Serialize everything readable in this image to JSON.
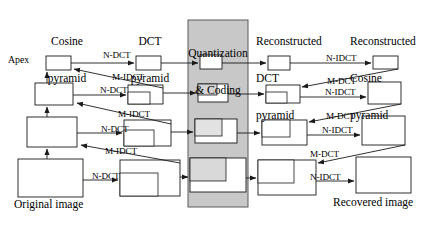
{
  "diagram": {
    "type": "block-flow",
    "colors": {
      "stroke": "#1a1a1a",
      "background": "#ffffff",
      "panel_fill": "#c8c8c8",
      "panel_stroke": "#555555",
      "nested_fill_light": "#e8e8e8",
      "nested_fill_mid": "#d4d4d4"
    },
    "headers": [
      {
        "id": "cosine-pyramid",
        "lines": [
          "Cosine",
          "pyramid"
        ]
      },
      {
        "id": "dct-pyramid",
        "lines": [
          "DCT",
          "pyramid"
        ]
      },
      {
        "id": "quantization-coding",
        "lines": [
          "Quantization",
          "& Coding"
        ]
      },
      {
        "id": "reconstructed-dct-pyramid",
        "lines": [
          "Reconstructed",
          "DCT",
          "pyramid"
        ]
      },
      {
        "id": "reconstructed-cosine-pyramid",
        "lines": [
          "Reconstructed",
          "Cosine",
          "pyramid"
        ]
      }
    ],
    "captions": {
      "apex": "Apex",
      "original_image": "Original image",
      "recovered_image": "Recovered image"
    },
    "operations": {
      "forward_dct": "N-DCT",
      "inverse_dct_up": "M-IDCT",
      "inverse_dct": "N-IDCT",
      "forward_dct_down": "M-DCT"
    },
    "edge_labels": [
      {
        "id": "ndct-level-1",
        "text": "N-DCT",
        "x": 103,
        "y": 51
      },
      {
        "id": "midct-level-1",
        "text": "M-IDCT",
        "x": 112,
        "y": 73
      },
      {
        "id": "ndct-level-2",
        "text": "N-DCT",
        "x": 100,
        "y": 86
      },
      {
        "id": "midct-level-2",
        "text": "M-IDCT",
        "x": 118,
        "y": 110
      },
      {
        "id": "ndct-level-3",
        "text": "N-DCT",
        "x": 101,
        "y": 125
      },
      {
        "id": "midct-level-3",
        "text": "M-IDCT",
        "x": 105,
        "y": 147
      },
      {
        "id": "ndct-level-4",
        "text": "N-DCT",
        "x": 92,
        "y": 176
      },
      {
        "id": "nidct-level-1",
        "text": "N-IDCT",
        "x": 326,
        "y": 54
      },
      {
        "id": "mdct-level-1",
        "text": "M-DCT",
        "x": 327,
        "y": 77
      },
      {
        "id": "nidct-level-2",
        "text": "N-IDCT",
        "x": 325,
        "y": 91
      },
      {
        "id": "mdct-level-2",
        "text": "M-DCT",
        "x": 326,
        "y": 114
      },
      {
        "id": "nidct-level-3",
        "text": "N-IDCT",
        "x": 322,
        "y": 128
      },
      {
        "id": "mdct-level-3",
        "text": "M-DCT",
        "x": 310,
        "y": 152
      },
      {
        "id": "nidct-level-4",
        "text": "N-IDCT",
        "x": 310,
        "y": 180
      }
    ],
    "levels": [
      {
        "level": 1,
        "cosine": {
          "x": 46,
          "y": 56,
          "w": 25,
          "h": 14
        },
        "dct": {
          "x": 136,
          "y": 56,
          "w": 25,
          "h": 14,
          "nested": null
        },
        "quant": {
          "x": 200,
          "y": 55,
          "w": 22,
          "h": 14,
          "nested": null
        },
        "recon_dct": {
          "x": 268,
          "y": 56,
          "w": 22,
          "h": 14,
          "nested": null
        },
        "recon_cos": {
          "x": 373,
          "y": 56,
          "w": 25,
          "h": 13
        }
      },
      {
        "level": 2,
        "cosine": {
          "x": 35,
          "y": 83,
          "w": 38,
          "h": 22
        },
        "dct": {
          "x": 128,
          "y": 85,
          "w": 35,
          "h": 19,
          "nested": {
            "x": 128,
            "y": 92,
            "w": 22,
            "h": 12
          }
        },
        "quant": {
          "x": 198,
          "y": 84,
          "w": 30,
          "h": 18,
          "nested": {
            "x": 198,
            "y": 91,
            "w": 19,
            "h": 11
          }
        },
        "recon_dct": {
          "x": 266,
          "y": 85,
          "w": 34,
          "h": 18,
          "nested": {
            "x": 266,
            "y": 92,
            "w": 21,
            "h": 11
          }
        },
        "recon_cos": {
          "x": 368,
          "y": 82,
          "w": 33,
          "h": 22
        }
      },
      {
        "level": 3,
        "cosine": {
          "x": 27,
          "y": 117,
          "w": 50,
          "h": 30
        },
        "dct": {
          "x": 124,
          "y": 120,
          "w": 47,
          "h": 26,
          "nested": {
            "x": 124,
            "y": 130,
            "w": 30,
            "h": 16
          }
        },
        "quant": {
          "x": 195,
          "y": 119,
          "w": 42,
          "h": 24,
          "nested": {
            "x": 195,
            "y": 119,
            "w": 27,
            "h": 17
          }
        },
        "recon_dct": {
          "x": 262,
          "y": 120,
          "w": 45,
          "h": 25,
          "nested": {
            "x": 262,
            "y": 120,
            "w": 28,
            "h": 17
          }
        },
        "recon_cos": {
          "x": 362,
          "y": 116,
          "w": 43,
          "h": 29
        }
      },
      {
        "level": 4,
        "cosine": {
          "x": 18,
          "y": 159,
          "w": 65,
          "h": 38
        },
        "dct": {
          "x": 120,
          "y": 160,
          "w": 60,
          "h": 36,
          "nested": {
            "x": 120,
            "y": 173,
            "w": 38,
            "h": 23
          }
        },
        "quant": {
          "x": 190,
          "y": 158,
          "w": 56,
          "h": 34,
          "nested": {
            "x": 190,
            "y": 158,
            "w": 36,
            "h": 23
          }
        },
        "recon_dct": {
          "x": 258,
          "y": 160,
          "w": 58,
          "h": 35,
          "nested": {
            "x": 258,
            "y": 160,
            "w": 36,
            "h": 23
          }
        },
        "recon_cos": {
          "x": 356,
          "y": 157,
          "w": 55,
          "h": 36
        }
      }
    ],
    "panel": {
      "x": 188,
      "y": 20,
      "w": 60,
      "h": 187
    }
  }
}
